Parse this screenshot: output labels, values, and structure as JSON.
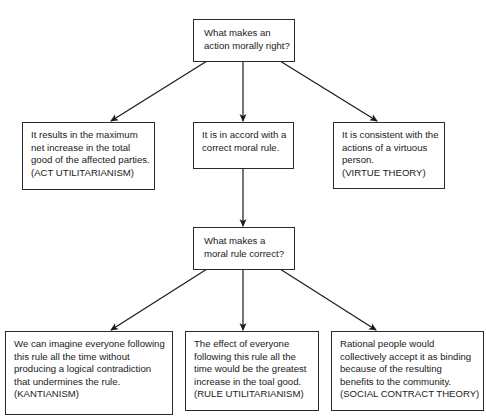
{
  "diagram": {
    "type": "flowchart",
    "nodes": {
      "root_question": {
        "lines": [
          "What makes an",
          "action morally right?"
        ]
      },
      "act_utilitarianism": {
        "lines": [
          "It results in the maximum",
          "net increase in the total",
          "good of the affected parties.",
          "(ACT UTILITARIANISM)"
        ]
      },
      "moral_rule": {
        "lines": [
          "It is in accord with a",
          "correct moral rule."
        ]
      },
      "virtue_theory": {
        "lines": [
          "It is consistent with the",
          "actions of a virtuous",
          "person.",
          "(VIRTUE THEORY)"
        ]
      },
      "rule_question": {
        "lines": [
          "What makes a",
          "moral rule correct?"
        ]
      },
      "kantianism": {
        "lines": [
          "We can imagine everyone following",
          "this rule all the time without",
          "producing a logical contradiction",
          "that undermines the rule.",
          "(KANTIANISM)"
        ]
      },
      "rule_utilitarianism": {
        "lines": [
          "The effect of everyone",
          "following this rule all the",
          "time would be the greatest",
          "increase in the toal good.",
          "(RULE UTILITARIANISM)"
        ]
      },
      "social_contract": {
        "lines": [
          "Rational people would",
          "collectively accept it as binding",
          "because of the resulting",
          "benefits to the community.",
          "(SOCIAL CONTRACT THEORY)"
        ]
      }
    },
    "edges": [
      {
        "from": "root_question",
        "to": "act_utilitarianism"
      },
      {
        "from": "root_question",
        "to": "moral_rule"
      },
      {
        "from": "root_question",
        "to": "virtue_theory"
      },
      {
        "from": "moral_rule",
        "to": "rule_question"
      },
      {
        "from": "rule_question",
        "to": "kantianism"
      },
      {
        "from": "rule_question",
        "to": "rule_utilitarianism"
      },
      {
        "from": "rule_question",
        "to": "social_contract"
      }
    ],
    "colors": {
      "line": "#1a1a1a",
      "box_border": "#2a2a2a",
      "background": "#ffffff"
    }
  }
}
